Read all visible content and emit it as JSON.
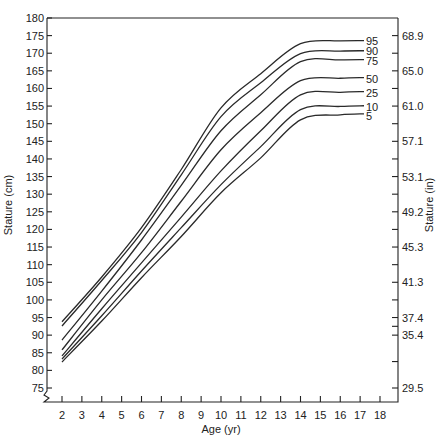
{
  "chart_data": {
    "type": "line",
    "title": "",
    "xlabel": "Age (yr)",
    "ylabel": "Stature (cm)",
    "ylabel_right": "Stature (in)",
    "xlim": [
      2,
      18
    ],
    "ylim": [
      75,
      180
    ],
    "x_ticks": [
      2,
      3,
      4,
      5,
      6,
      7,
      8,
      9,
      10,
      11,
      12,
      13,
      14,
      15,
      16,
      17,
      18
    ],
    "y_ticks_left": [
      75,
      80,
      85,
      90,
      95,
      100,
      105,
      110,
      115,
      120,
      125,
      130,
      135,
      140,
      145,
      150,
      155,
      160,
      165,
      170,
      175,
      180
    ],
    "y_ticks_right": [
      {
        "label": "68.9",
        "cm": 175
      },
      {
        "label": "65.0",
        "cm": 165
      },
      {
        "label": "61.0",
        "cm": 155
      },
      {
        "label": "57.1",
        "cm": 145
      },
      {
        "label": "53.1",
        "cm": 135
      },
      {
        "label": "49.2",
        "cm": 125
      },
      {
        "label": "45.3",
        "cm": 115
      },
      {
        "label": "41.3",
        "cm": 105
      },
      {
        "label": "37.4",
        "cm": 95
      },
      {
        "label": "35.4",
        "cm": 90
      },
      {
        "label": "29.5",
        "cm": 75
      }
    ],
    "grid": false,
    "legend_position": "inline-right",
    "data_note": "Curve values are visual estimates from the screenshot (approx. +/-1-2 cm); values at ages 4 and 8 are interpolated, not read.",
    "x": [
      2,
      4,
      6,
      8,
      10,
      12,
      14,
      16,
      18
    ],
    "series": [
      {
        "name": "95",
        "values": [
          93.8,
          106.5,
          120.5,
          137.0,
          154.5,
          164.2,
          172.7,
          173.5,
          173.6
        ]
      },
      {
        "name": "90",
        "values": [
          92.6,
          105.5,
          119.1,
          135.5,
          152.0,
          161.6,
          169.9,
          170.6,
          170.7
        ]
      },
      {
        "name": "75",
        "values": [
          88.6,
          102.5,
          117.0,
          132.5,
          148.0,
          158.2,
          167.6,
          168.1,
          168.2
        ]
      },
      {
        "name": "50",
        "values": [
          85.8,
          100.0,
          113.4,
          128.0,
          142.6,
          153.1,
          162.2,
          162.9,
          163.1
        ]
      },
      {
        "name": "25",
        "values": [
          84.1,
          97.5,
          110.5,
          123.5,
          136.6,
          148.0,
          158.2,
          158.9,
          159.1
        ]
      },
      {
        "name": "10",
        "values": [
          83.2,
          95.5,
          108.2,
          120.5,
          132.7,
          143.5,
          154.0,
          154.9,
          155.1
        ]
      },
      {
        "name": "5",
        "values": [
          82.4,
          94.0,
          106.3,
          118.0,
          130.4,
          140.3,
          151.1,
          152.5,
          152.8
        ]
      }
    ]
  },
  "labels": {
    "xlabel": "Age (yr)",
    "ylabel_left": "Stature (cm)",
    "ylabel_right": "Stature (in)"
  }
}
